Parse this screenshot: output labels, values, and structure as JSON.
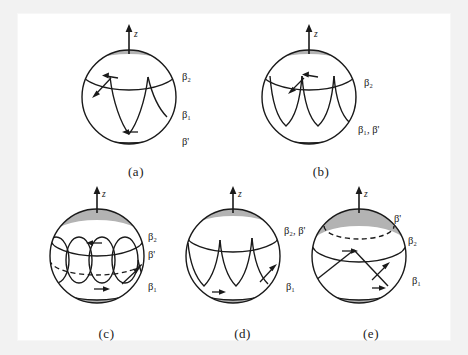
{
  "figure": {
    "background_color": "#f2f2f2",
    "panel_background": "#ffffff",
    "cap_fill": "#b3b3b3",
    "band_fill": "#ffffff",
    "stroke_color": "#1a1a1a",
    "axis_label": "z"
  },
  "panels": [
    {
      "id": "a",
      "caption": "(a)",
      "axis_label": "z",
      "labels": [
        {
          "name": "beta2",
          "text": "β₂"
        },
        {
          "name": "beta1",
          "text": "β₁"
        },
        {
          "name": "beta-prime",
          "text": "β'"
        }
      ]
    },
    {
      "id": "b",
      "caption": "(b)",
      "axis_label": "z",
      "labels": [
        {
          "name": "beta2",
          "text": "β₂"
        },
        {
          "name": "beta1-beta-prime",
          "text": "β₁, β'"
        }
      ]
    },
    {
      "id": "c",
      "caption": "(c)",
      "axis_label": "z",
      "labels": [
        {
          "name": "beta2",
          "text": "β₂"
        },
        {
          "name": "beta-prime",
          "text": "β'"
        },
        {
          "name": "beta1",
          "text": "β₁"
        }
      ]
    },
    {
      "id": "d",
      "caption": "(d)",
      "axis_label": "z",
      "labels": [
        {
          "name": "beta2-beta-prime",
          "text": "β₂, β'"
        },
        {
          "name": "beta1",
          "text": "β₁"
        }
      ]
    },
    {
      "id": "e",
      "caption": "(e)",
      "axis_label": "z",
      "labels": [
        {
          "name": "beta-prime",
          "text": "β'"
        },
        {
          "name": "beta2",
          "text": "β₂"
        },
        {
          "name": "beta1",
          "text": "β₁"
        }
      ]
    }
  ]
}
